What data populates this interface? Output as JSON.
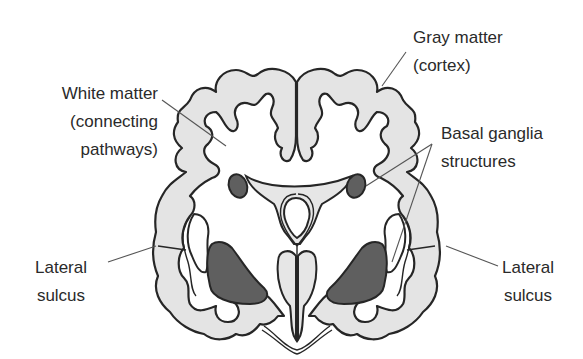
{
  "labels": {
    "gray_matter": {
      "line1": "Gray matter",
      "line2": "(cortex)"
    },
    "white_matter": {
      "line1": "White matter",
      "line2": "(connecting",
      "line3": "pathways)"
    },
    "basal_ganglia": {
      "line1": "Basal ganglia",
      "line2": "structures"
    },
    "lateral_sulcus_left": {
      "line1": "Lateral",
      "line2": "sulcus"
    },
    "lateral_sulcus_right": {
      "line1": "Lateral",
      "line2": "sulcus"
    }
  },
  "colors": {
    "gray_matter": "#e4e4e4",
    "basal_ganglia": "#5f5f5f",
    "outline": "#262626",
    "text": "#2a2a2a"
  }
}
